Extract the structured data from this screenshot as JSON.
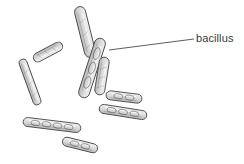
{
  "figure": {
    "type": "scientific-illustration",
    "background_color": "#ffffff",
    "ink_color": "#4a4a4a",
    "fill_color": "#e6e6e6",
    "width": 244,
    "height": 164,
    "annotations": [
      {
        "id": "bacillus-label",
        "text": "bacillus",
        "x": 196,
        "y": 32,
        "leader_line": {
          "from_x": 109,
          "from_y": 50,
          "to_x": 194,
          "to_y": 39
        }
      }
    ],
    "organisms": [
      {
        "id": "rod-1",
        "name": "bacillus-rod-top-center",
        "cx": 85,
        "cy": 32,
        "length": 52,
        "width": 11,
        "angle": 76,
        "segmented": false
      },
      {
        "id": "rod-2",
        "name": "bacillus-rod-upper-left",
        "cx": 48,
        "cy": 52,
        "length": 32,
        "width": 9,
        "angle": 152,
        "segmented": false
      },
      {
        "id": "rod-3",
        "name": "bacillus-rod-left-long",
        "cx": 30,
        "cy": 82,
        "length": 48,
        "width": 8,
        "angle": 70,
        "segmented": false
      },
      {
        "id": "rod-4",
        "name": "bacillus-rod-center-long",
        "cx": 92,
        "cy": 68,
        "length": 62,
        "width": 11,
        "angle": 108,
        "segmented": true
      },
      {
        "id": "rod-5",
        "name": "bacillus-rod-center-right",
        "cx": 102,
        "cy": 76,
        "length": 38,
        "width": 10,
        "angle": 99,
        "segmented": false
      },
      {
        "id": "rod-6",
        "name": "bacillus-chain-mid-right",
        "cx": 124,
        "cy": 97,
        "length": 36,
        "width": 9,
        "angle": 7,
        "segmented": true
      },
      {
        "id": "rod-7",
        "name": "bacillus-chain-lower-right",
        "cx": 123,
        "cy": 112,
        "length": 48,
        "width": 9,
        "angle": 9,
        "segmented": true
      },
      {
        "id": "rod-8",
        "name": "bacillus-chain-lower-left",
        "cx": 52,
        "cy": 125,
        "length": 58,
        "width": 9,
        "angle": 7,
        "segmented": true
      },
      {
        "id": "rod-9",
        "name": "bacillus-chain-bottom",
        "cx": 80,
        "cy": 145,
        "length": 36,
        "width": 9,
        "angle": 14,
        "segmented": true
      }
    ]
  }
}
